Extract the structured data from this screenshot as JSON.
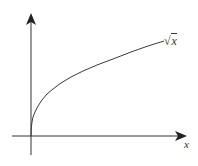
{
  "diagram": {
    "type": "function-plot",
    "function": "sqrt(x)",
    "curve_label": {
      "radical": "√",
      "argument": "x"
    },
    "x_axis_label": "x",
    "colors": {
      "axes": "#333333",
      "curve": "#3a3a3a",
      "background": "#ffffff"
    }
  }
}
